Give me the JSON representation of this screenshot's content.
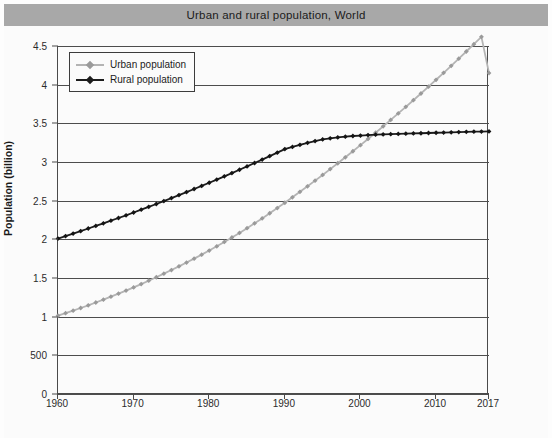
{
  "title": "Urban and rural population, World",
  "caption": "",
  "axes": {
    "ylabel": "Population (billion)",
    "xlabel": "",
    "ytick_labels": [
      "4.5",
      "4",
      "3.5",
      "3",
      "2.5",
      "2",
      "1.5",
      "1",
      "500",
      "0"
    ],
    "ytick_values": [
      4.5,
      4,
      3.5,
      3,
      2.5,
      2,
      1.5,
      1,
      0.5,
      0
    ],
    "xtick_labels": [
      "1960",
      "1970",
      "1980",
      "1990",
      "2000",
      "2010",
      "2017"
    ],
    "xtick_values": [
      1960,
      1970,
      1980,
      1990,
      2000,
      2010,
      2017
    ]
  },
  "legend": {
    "position": "top-left",
    "items": [
      {
        "label": "Urban population",
        "color": "#b4b4b4"
      },
      {
        "label": "Rural population",
        "color": "#1c1c1c"
      }
    ]
  },
  "colors": {
    "title_bar": "#a8a8a8",
    "plot_background": "#fbfbfb",
    "gridline": "#4d4d4d",
    "axis": "#4a4a4a",
    "urban": "#b4b4b4",
    "rural": "#1c1c1c"
  },
  "chart_data": {
    "type": "line",
    "title": "Urban and rural population, World",
    "xlabel": "",
    "ylabel": "Population (billion)",
    "xlim": [
      1960,
      2017
    ],
    "ylim": [
      0,
      4.5
    ],
    "grid": true,
    "legend_position": "top-left",
    "x": [
      1960,
      1961,
      1962,
      1963,
      1964,
      1965,
      1966,
      1967,
      1968,
      1969,
      1970,
      1971,
      1972,
      1973,
      1974,
      1975,
      1976,
      1977,
      1978,
      1979,
      1980,
      1981,
      1982,
      1983,
      1984,
      1985,
      1986,
      1987,
      1988,
      1989,
      1990,
      1991,
      1992,
      1993,
      1994,
      1995,
      1996,
      1997,
      1998,
      1999,
      2000,
      2001,
      2002,
      2003,
      2004,
      2005,
      2006,
      2007,
      2008,
      2009,
      2010,
      2011,
      2012,
      2013,
      2014,
      2015,
      2016,
      2017
    ],
    "series": [
      {
        "name": "Urban population",
        "color": "#b4b4b4",
        "values": [
          1.013,
          1.045,
          1.078,
          1.112,
          1.147,
          1.183,
          1.22,
          1.258,
          1.297,
          1.337,
          1.378,
          1.421,
          1.465,
          1.51,
          1.556,
          1.603,
          1.651,
          1.7,
          1.75,
          1.802,
          1.855,
          1.91,
          1.966,
          2.024,
          2.083,
          2.144,
          2.207,
          2.271,
          2.337,
          2.404,
          2.473,
          2.543,
          2.614,
          2.686,
          2.759,
          2.833,
          2.908,
          2.984,
          3.061,
          3.139,
          3.218,
          3.298,
          3.379,
          3.461,
          3.544,
          3.628,
          3.713,
          3.799,
          3.886,
          3.974,
          4.063,
          4.153,
          4.244,
          4.336,
          4.429,
          4.523,
          4.618,
          4.15
        ]
      },
      {
        "name": "Rural population",
        "color": "#1c1c1c",
        "values": [
          2.01,
          2.042,
          2.074,
          2.107,
          2.14,
          2.173,
          2.207,
          2.241,
          2.276,
          2.311,
          2.347,
          2.383,
          2.42,
          2.457,
          2.495,
          2.533,
          2.572,
          2.611,
          2.651,
          2.691,
          2.732,
          2.773,
          2.815,
          2.857,
          2.9,
          2.943,
          2.987,
          3.031,
          3.076,
          3.121,
          3.167,
          3.195,
          3.222,
          3.248,
          3.271,
          3.292,
          3.306,
          3.318,
          3.328,
          3.336,
          3.342,
          3.348,
          3.353,
          3.357,
          3.36,
          3.363,
          3.366,
          3.369,
          3.372,
          3.375,
          3.378,
          3.381,
          3.384,
          3.387,
          3.39,
          3.392,
          3.394,
          3.396
        ]
      }
    ]
  }
}
